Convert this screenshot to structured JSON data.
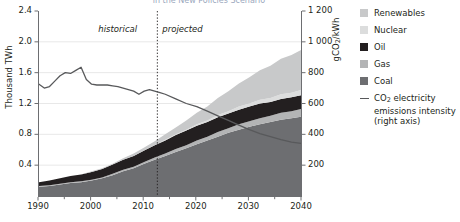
{
  "title": "in the New Policies Scenario",
  "axes": {
    "left": {
      "label": "Thousand TWh",
      "ticks": [
        "2.4",
        "2.0",
        "1.6",
        "1.2",
        "0.8",
        "0.4"
      ],
      "min": 0,
      "max": 2.4
    },
    "right": {
      "label_main": "gCO",
      "label_sub": "2",
      "label_tail": "/kWh",
      "ticks": [
        "1 200",
        "1 000",
        "800",
        "600",
        "400",
        "200"
      ],
      "min": 0,
      "max": 1200
    },
    "x": {
      "ticks": [
        "1990",
        "2000",
        "2010",
        "2020",
        "2030",
        "2040"
      ],
      "min": 1990,
      "max": 2040
    }
  },
  "annotations": {
    "historical": "historical",
    "projected": "projected",
    "divider_year": 2012.5
  },
  "legend": {
    "items": [
      {
        "label": "Renewables",
        "color": "#c8c9ca",
        "type": "swatch"
      },
      {
        "label": "Nuclear",
        "color": "#dcdddd",
        "type": "swatch"
      },
      {
        "label": "Oil",
        "color": "#231f20",
        "type": "swatch"
      },
      {
        "label": "Gas",
        "color": "#b3b4b5",
        "type": "swatch"
      },
      {
        "label": "Coal",
        "color": "#6d6e71",
        "type": "swatch"
      },
      {
        "label": "CO₂ electricity emissions intensity (right axis)",
        "color": "#58595b",
        "type": "line"
      }
    ]
  },
  "chart_data": {
    "type": "area",
    "title": "in the New Policies Scenario",
    "xlabel": "",
    "ylabel": "Thousand TWh",
    "y2label": "gCO2/kWh",
    "xlim": [
      1990,
      2040
    ],
    "ylim": [
      0,
      2.4
    ],
    "y2lim": [
      0,
      1200
    ],
    "grid": true,
    "legend_position": "right",
    "stacked": true,
    "x": [
      1990,
      1992,
      1994,
      1996,
      1998,
      2000,
      2002,
      2004,
      2006,
      2008,
      2010,
      2012,
      2014,
      2016,
      2018,
      2020,
      2022,
      2024,
      2026,
      2028,
      2030,
      2032,
      2034,
      2036,
      2038,
      2040
    ],
    "series": [
      {
        "name": "Coal",
        "color": "#6d6e71",
        "values": [
          0.12,
          0.13,
          0.15,
          0.17,
          0.18,
          0.2,
          0.23,
          0.27,
          0.32,
          0.36,
          0.42,
          0.47,
          0.52,
          0.57,
          0.62,
          0.67,
          0.72,
          0.77,
          0.82,
          0.86,
          0.9,
          0.93,
          0.96,
          0.99,
          1.01,
          1.03
        ]
      },
      {
        "name": "Gas",
        "color": "#b3b4b5",
        "values": [
          0.01,
          0.01,
          0.01,
          0.01,
          0.01,
          0.01,
          0.01,
          0.02,
          0.02,
          0.02,
          0.02,
          0.03,
          0.03,
          0.04,
          0.04,
          0.05,
          0.05,
          0.06,
          0.06,
          0.07,
          0.07,
          0.08,
          0.08,
          0.09,
          0.09,
          0.1
        ]
      },
      {
        "name": "Oil",
        "color": "#231f20",
        "values": [
          0.05,
          0.06,
          0.07,
          0.08,
          0.09,
          0.1,
          0.11,
          0.12,
          0.13,
          0.14,
          0.15,
          0.16,
          0.17,
          0.18,
          0.19,
          0.19,
          0.19,
          0.19,
          0.19,
          0.19,
          0.19,
          0.19,
          0.18,
          0.18,
          0.18,
          0.18
        ]
      },
      {
        "name": "Nuclear",
        "color": "#dcdddd",
        "values": [
          0.0,
          0.0,
          0.0,
          0.0,
          0.0,
          0.0,
          0.0,
          0.0,
          0.0,
          0.0,
          0.0,
          0.0,
          0.01,
          0.01,
          0.01,
          0.02,
          0.02,
          0.03,
          0.03,
          0.04,
          0.04,
          0.05,
          0.05,
          0.06,
          0.06,
          0.07
        ]
      },
      {
        "name": "Renewables",
        "color": "#c8c9ca",
        "values": [
          0.0,
          0.0,
          0.0,
          0.0,
          0.0,
          0.01,
          0.01,
          0.01,
          0.02,
          0.03,
          0.04,
          0.05,
          0.07,
          0.09,
          0.12,
          0.15,
          0.18,
          0.22,
          0.26,
          0.3,
          0.34,
          0.38,
          0.42,
          0.46,
          0.49,
          0.52
        ]
      }
    ],
    "line_series": {
      "name": "CO2 electricity emissions intensity",
      "axis": "right",
      "color": "#58595b",
      "unit": "gCO2/kWh",
      "x": [
        1990,
        1991,
        1992,
        1993,
        1994,
        1995,
        1996,
        1997,
        1998,
        1999,
        2000,
        2001,
        2002,
        2003,
        2004,
        2005,
        2006,
        2007,
        2008,
        2009,
        2010,
        2011,
        2012,
        2013,
        2014,
        2016,
        2018,
        2020,
        2022,
        2024,
        2026,
        2028,
        2030,
        2032,
        2034,
        2036,
        2038,
        2040
      ],
      "values": [
        725,
        700,
        710,
        745,
        780,
        800,
        795,
        815,
        835,
        755,
        725,
        720,
        720,
        720,
        715,
        710,
        700,
        690,
        680,
        660,
        680,
        690,
        680,
        670,
        660,
        630,
        600,
        580,
        550,
        520,
        490,
        460,
        430,
        405,
        385,
        365,
        350,
        340
      ]
    }
  }
}
